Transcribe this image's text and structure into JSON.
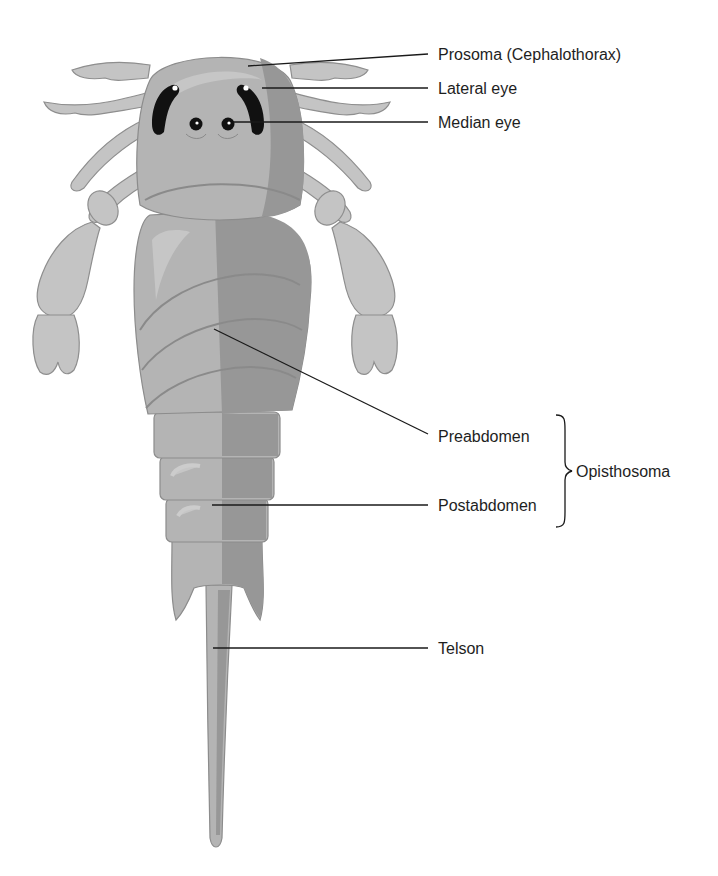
{
  "diagram": {
    "labels": {
      "prosoma": "Prosoma (Cephalothorax)",
      "lateral_eye": "Lateral eye",
      "median_eye": "Median eye",
      "preabdomen": "Preabdomen",
      "postabdomen": "Postabdomen",
      "opisthosoma": "Opisthosoma",
      "telson": "Telson"
    },
    "colors": {
      "body_light": "#b4b4b4",
      "body_dark": "#979797",
      "appendage": "#c4c4c4",
      "eye": "#111111",
      "leader_line": "#1a1a1a",
      "text": "#1e1e1e"
    }
  }
}
